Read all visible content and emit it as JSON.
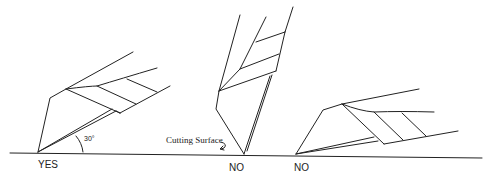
{
  "diagram": {
    "labels": {
      "yes": "YES",
      "no_vertical": "NO",
      "no_flat": "NO",
      "angle": "30°",
      "cutting_surface": "Cutting Surface"
    },
    "examples": [
      {
        "id": "correct",
        "verdict": "YES",
        "blade_angle_degrees": 30
      },
      {
        "id": "too-steep",
        "verdict": "NO"
      },
      {
        "id": "too-shallow",
        "verdict": "NO"
      }
    ]
  }
}
